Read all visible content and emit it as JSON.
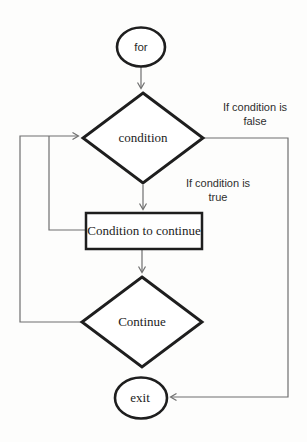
{
  "diagram": {
    "type": "flowchart",
    "nodes": {
      "for": {
        "label": "for"
      },
      "condition": {
        "label": "condition"
      },
      "body": {
        "label": "Condition to continue"
      },
      "continue": {
        "label": "Continue"
      },
      "exit": {
        "label": "exit"
      }
    },
    "annotations": {
      "false_branch": {
        "line1": "If condition is",
        "line2": "false"
      },
      "true_branch": {
        "line1": "If condition is",
        "line2": "true"
      }
    },
    "colors": {
      "shape_stroke": "#1e1e1e",
      "connector": "#6f6f6f",
      "text": "#1c1c1c",
      "background": "#fdfdfc"
    }
  }
}
